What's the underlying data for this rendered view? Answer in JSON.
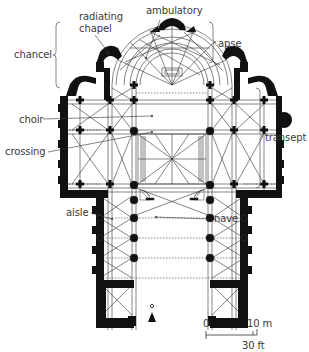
{
  "diagram": {
    "type": "architectural-floor-plan",
    "labels": {
      "ambulatory": "ambulatory",
      "radiating_chapel_line1": "radiating",
      "radiating_chapel_line2": "chapel",
      "chancel": "chancel",
      "apse": "apse",
      "transept": "transept",
      "choir": "choir",
      "crossing": "crossing",
      "aisle": "aisle",
      "nave": "nave"
    },
    "scale_bar": {
      "zero": "0",
      "metric": "10 m",
      "imperial": "30 ft"
    },
    "colors": {
      "wall": "#111111",
      "line": "#333333",
      "text": "#3a3a3a",
      "background": "#ffffff"
    }
  }
}
